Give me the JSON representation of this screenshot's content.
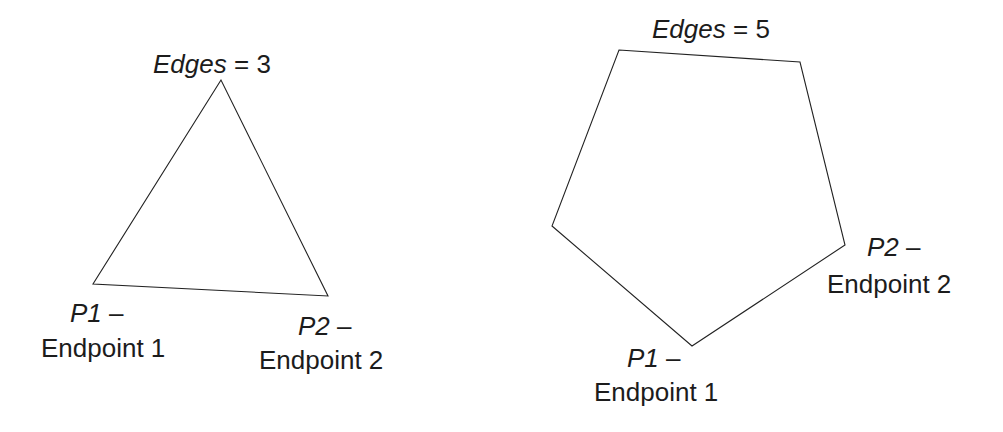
{
  "figures": [
    {
      "id": "triangle",
      "edges_label_var": "Edges",
      "edges_label_eq": " = ",
      "edges_value": "3",
      "points": "221,80 93,284 328,296",
      "p1": {
        "var": "P1",
        "dash": " –",
        "desc": "Endpoint 1"
      },
      "p2": {
        "var": "P2",
        "dash": " –",
        "desc": "Endpoint 2"
      }
    },
    {
      "id": "pentagon",
      "edges_label_var": "Edges",
      "edges_label_eq": " = ",
      "edges_value": "5",
      "points": "619,50 800,62 845,245 692,346 552,226",
      "p1": {
        "var": "P1",
        "dash": " –",
        "desc": "Endpoint 1"
      },
      "p2": {
        "var": "P2",
        "dash": " –",
        "desc": "Endpoint 2"
      }
    }
  ],
  "colors": {
    "stroke": "#222222",
    "text": "#1c1c1c",
    "background": "#ffffff"
  }
}
